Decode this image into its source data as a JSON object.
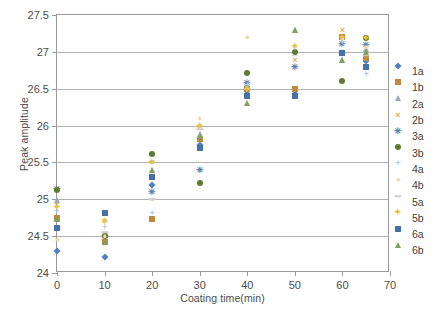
{
  "chart_data": {
    "type": "scatter",
    "title": "",
    "xlabel": "Coating time(min)",
    "ylabel": "Peak amplitude",
    "xlim": [
      0,
      70
    ],
    "ylim": [
      24,
      27.5
    ],
    "xticks": [
      0,
      10,
      20,
      30,
      40,
      50,
      60,
      70
    ],
    "yticks": [
      24,
      24.5,
      25,
      25.5,
      26,
      26.5,
      27,
      27.5
    ],
    "xtick_labels": [
      "0",
      "10",
      "20",
      "30",
      "40",
      "50",
      "60",
      "70"
    ],
    "ytick_labels": [
      "24",
      "24.5",
      "25",
      "25.5",
      "26",
      "26.5",
      "27",
      "27.5"
    ],
    "grid": "horizontal",
    "legend_position": "right",
    "series": [
      {
        "name": "1a",
        "marker": "diamond",
        "color": "#4f81bd",
        "x": [
          0,
          10,
          20,
          30,
          40,
          50,
          60,
          65
        ],
        "y": [
          24.3,
          24.22,
          25.2,
          25.73,
          26.43,
          26.43,
          26.99,
          26.88
        ]
      },
      {
        "name": "1b",
        "marker": "square",
        "color": "#c0883b",
        "x": [
          0,
          10,
          20,
          30,
          40,
          50,
          60,
          65
        ],
        "y": [
          24.74,
          24.42,
          24.73,
          25.82,
          26.5,
          26.5,
          27.2,
          26.92
        ]
      },
      {
        "name": "2a",
        "marker": "triangle",
        "color": "#9aa6b5",
        "x": [
          0,
          10,
          20,
          30,
          40,
          50,
          60,
          65
        ],
        "y": [
          24.99,
          24.52,
          25.4,
          25.88,
          26.56,
          27.3,
          26.89,
          27.04
        ]
      },
      {
        "name": "2b",
        "marker": "cross",
        "color": "#d9b64e",
        "x": [
          0,
          10,
          20,
          30,
          40,
          50,
          60,
          65
        ],
        "y": [
          24.92,
          24.71,
          25.5,
          26.0,
          26.5,
          26.89,
          27.3,
          27.19
        ]
      },
      {
        "name": "3a",
        "marker": "asterisk",
        "color": "#5b7fa8",
        "x": [
          0,
          10,
          20,
          30,
          40,
          50,
          60,
          65
        ],
        "y": [
          25.14,
          24.5,
          25.1,
          25.4,
          26.58,
          26.79,
          27.1,
          27.09
        ]
      },
      {
        "name": "3b",
        "marker": "circle",
        "color": "#5f7a2e",
        "x": [
          0,
          10,
          20,
          30,
          40,
          50,
          60,
          65
        ],
        "y": [
          25.12,
          24.5,
          25.61,
          25.22,
          26.71,
          27.0,
          26.6,
          27.19
        ]
      },
      {
        "name": "4a",
        "marker": "plus",
        "color": "#b8c9e0",
        "x": [
          0,
          10,
          20,
          30,
          40,
          50,
          60,
          65
        ],
        "y": [
          24.84,
          24.62,
          24.82,
          25.84,
          26.55,
          27.05,
          27.14,
          26.7
        ]
      },
      {
        "name": "4b",
        "marker": "dot",
        "color": "#efd9b0",
        "x": [
          0,
          10,
          20,
          30,
          40,
          50,
          60,
          65
        ],
        "y": [
          24.45,
          24.5,
          25.0,
          26.1,
          27.2,
          27.06,
          27.18,
          27.06
        ]
      },
      {
        "name": "5a",
        "marker": "dash",
        "color": "#cfcfcf",
        "x": [
          0,
          10,
          20,
          30,
          40,
          50,
          60,
          65
        ],
        "y": [
          24.63,
          24.55,
          25.0,
          25.95,
          26.5,
          26.95,
          27.0,
          26.95
        ]
      },
      {
        "name": "5b",
        "marker": "star",
        "color": "#e8c33c",
        "x": [
          0,
          10,
          20,
          30,
          40,
          50,
          60,
          65
        ],
        "y": [
          24.9,
          24.71,
          25.5,
          26.0,
          26.5,
          27.08,
          27.2,
          27.19
        ]
      },
      {
        "name": "6a",
        "marker": "square",
        "color": "#4472a8",
        "x": [
          0,
          10,
          20,
          30,
          40,
          50,
          60,
          65
        ],
        "y": [
          24.61,
          24.82,
          25.3,
          25.7,
          26.4,
          26.4,
          26.99,
          26.79
        ]
      },
      {
        "name": "6b",
        "marker": "triangle",
        "color": "#7fa15a",
        "x": [
          0,
          10,
          20,
          30,
          40,
          50,
          60,
          65
        ],
        "y": [
          24.73,
          24.42,
          25.4,
          25.86,
          26.3,
          27.3,
          26.89,
          27.0
        ]
      }
    ]
  },
  "axes": {
    "y_title": "Peak amplitude",
    "x_title": "Coating time(min)"
  },
  "legend": {
    "items": [
      {
        "label": "1a"
      },
      {
        "label": "1b"
      },
      {
        "label": "2a"
      },
      {
        "label": "2b"
      },
      {
        "label": "3a"
      },
      {
        "label": "3b"
      },
      {
        "label": "4a"
      },
      {
        "label": "4b"
      },
      {
        "label": "5a"
      },
      {
        "label": "5b"
      },
      {
        "label": "6a"
      },
      {
        "label": "6b"
      }
    ]
  },
  "colors": {
    "gridline": "#b3b3b3",
    "frame": "#9a9a9a",
    "text": "#4d4d4d",
    "background": "#ffffff"
  }
}
